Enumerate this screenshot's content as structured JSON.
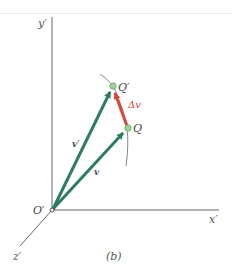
{
  "figure": {
    "caption": "(b)",
    "axes": {
      "x": "x′",
      "y": "y′",
      "z": "z′",
      "origin": "O′"
    },
    "points": {
      "q": "Q",
      "q_prime": "Q′"
    },
    "vectors": {
      "v": "v",
      "v_prime": "v′",
      "delta_v": "Δv"
    },
    "colors": {
      "vector_green": "#2e7d5f",
      "delta_red": "#d9463a",
      "axis_gray": "#555555",
      "point_fill": "#9fcf9a",
      "label_red": "#d9463a"
    }
  }
}
